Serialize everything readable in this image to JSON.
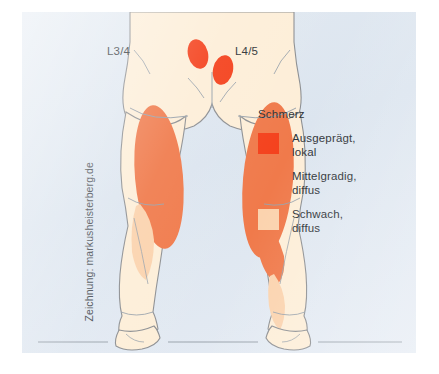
{
  "figure": {
    "panel_background": "#dfe7f0",
    "credit": "Zeichnung: markusheisterberg.de",
    "vertebra_labels": [
      {
        "name": "left",
        "text": "L3/4"
      },
      {
        "name": "right",
        "text": "L4/5"
      }
    ]
  },
  "legend": {
    "title": "Schmerz",
    "items": [
      {
        "line1": "Ausgeprägt,",
        "line2": "lokal",
        "color": "#f4411c",
        "icon": "severity-swatch"
      },
      {
        "line1": "Mittelgradig,",
        "line2": "diffus",
        "color": "#f07a4b",
        "icon": "severity-swatch"
      },
      {
        "line1": "Schwach,",
        "line2": "diffus",
        "color": "#fbd3ae",
        "icon": "severity-swatch"
      }
    ]
  },
  "illustration": {
    "view": "posterior-lower-body",
    "skin_color": "#fdeed8",
    "outline_color": "#8d8f92",
    "ground_line_color": "#9aa3ac",
    "pain_regions": [
      {
        "region": "sacroiliac-left",
        "severity": "Ausgeprägt, lokal",
        "color": "#f4411c"
      },
      {
        "region": "sacroiliac-right",
        "severity": "Ausgeprägt, lokal",
        "color": "#f4411c"
      },
      {
        "region": "posterior-thigh-left",
        "severity": "Mittelgradig, diffus",
        "color": "#f07a4b"
      },
      {
        "region": "posterior-thigh-right",
        "severity": "Mittelgradig, diffus",
        "color": "#f07a4b"
      },
      {
        "region": "calf-right",
        "severity": "Mittelgradig, diffus",
        "color": "#f07a4b"
      },
      {
        "region": "calf-left",
        "severity": "Schwach, diffus",
        "color": "#fbd3ae"
      },
      {
        "region": "lower-leg-right",
        "severity": "Schwach, diffus",
        "color": "#fbd3ae"
      }
    ]
  }
}
